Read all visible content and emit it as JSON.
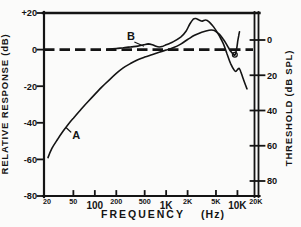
{
  "figure": {
    "background": "#fbfbfa",
    "ink": "#141414"
  },
  "chart_data": {
    "type": "line",
    "title": "",
    "xlabel_parts": [
      "FREQUENCY",
      "(Hz)"
    ],
    "x_scale": "log",
    "x_range_hz": [
      20,
      20000
    ],
    "grid": false,
    "legend": "none (curves labeled A and B with leader lines)",
    "left_axis": {
      "label": "RELATIVE RESPONSE (dB)",
      "tick_labels": [
        "+20",
        "0",
        "-20",
        "-40",
        "-60",
        "-80"
      ],
      "tick_values": [
        20,
        0,
        -20,
        -40,
        -60,
        -80
      ],
      "range": [
        -80,
        20
      ]
    },
    "right_axis": {
      "label": "THRESHOLD (dB SPL)",
      "tick_labels": [
        "0",
        "20",
        "40",
        "60",
        "80"
      ],
      "tick_values": [
        0,
        20,
        40,
        60,
        80
      ],
      "direction": "increases-downward",
      "style": "double-line"
    },
    "x_ticks": [
      {
        "hz": 20,
        "label": "20",
        "size": "small",
        "tick": false
      },
      {
        "hz": 50,
        "label": "50",
        "size": "small",
        "tick": true
      },
      {
        "hz": 100,
        "label": "100",
        "size": "large",
        "tick": true
      },
      {
        "hz": 200,
        "label": "200",
        "size": "small",
        "tick": true
      },
      {
        "hz": 500,
        "label": "500",
        "size": "small",
        "tick": true
      },
      {
        "hz": 1000,
        "label": "1K",
        "size": "large",
        "tick": true
      },
      {
        "hz": 2000,
        "label": "2K",
        "size": "small",
        "tick": true
      },
      {
        "hz": 5000,
        "label": "5K",
        "size": "small",
        "tick": true
      },
      {
        "hz": 10000,
        "label": "10K",
        "size": "large",
        "tick": true
      },
      {
        "hz": 20000,
        "label": "20K",
        "size": "small",
        "tick": false
      }
    ],
    "zero_line": {
      "value": 0,
      "style": "dashed"
    },
    "series": [
      {
        "name": "A",
        "points": [
          [
            22,
            -59
          ],
          [
            25,
            -54
          ],
          [
            30,
            -49
          ],
          [
            36,
            -44.5
          ],
          [
            43,
            -40.5
          ],
          [
            50,
            -37.5
          ],
          [
            63,
            -33
          ],
          [
            80,
            -28.5
          ],
          [
            100,
            -24.5
          ],
          [
            125,
            -20.5
          ],
          [
            160,
            -16.5
          ],
          [
            200,
            -13
          ],
          [
            250,
            -10
          ],
          [
            320,
            -7.5
          ],
          [
            400,
            -5.6
          ],
          [
            500,
            -4.1
          ],
          [
            630,
            -2.8
          ],
          [
            800,
            -1.5
          ],
          [
            1000,
            -0.3
          ],
          [
            1250,
            1
          ],
          [
            1600,
            3
          ],
          [
            2000,
            5.5
          ],
          [
            2500,
            7.8
          ],
          [
            3150,
            9.5
          ],
          [
            4000,
            10.6
          ],
          [
            4600,
            10.6
          ],
          [
            5000,
            9.8
          ],
          [
            5600,
            8.3
          ],
          [
            6300,
            5.8
          ],
          [
            7000,
            3
          ],
          [
            7500,
            1
          ],
          [
            8000,
            -0.8
          ],
          [
            8600,
            -2.2
          ],
          [
            9200,
            -3
          ],
          [
            9700,
            0
          ],
          [
            10100,
            4.5
          ],
          [
            10400,
            7.5
          ],
          [
            10700,
            9.8
          ]
        ]
      },
      {
        "name": "B",
        "points": [
          [
            150,
            0.2
          ],
          [
            200,
            0.6
          ],
          [
            250,
            1
          ],
          [
            320,
            1.5
          ],
          [
            400,
            1.9
          ],
          [
            480,
            2.6
          ],
          [
            560,
            3.1
          ],
          [
            640,
            2.7
          ],
          [
            720,
            1.8
          ],
          [
            800,
            1.4
          ],
          [
            900,
            1.8
          ],
          [
            1000,
            2.6
          ],
          [
            1120,
            3.4
          ],
          [
            1250,
            4.2
          ],
          [
            1600,
            6.8
          ],
          [
            1900,
            10
          ],
          [
            2150,
            14
          ],
          [
            2400,
            16.6
          ],
          [
            2600,
            17
          ],
          [
            2900,
            16.2
          ],
          [
            3200,
            15.6
          ],
          [
            3600,
            16.2
          ],
          [
            4000,
            15.2
          ],
          [
            4500,
            13
          ],
          [
            5000,
            10.5
          ],
          [
            5600,
            7.3
          ],
          [
            6300,
            3.5
          ],
          [
            7100,
            -2
          ],
          [
            8000,
            -7.5
          ],
          [
            9000,
            -11.2
          ],
          [
            9500,
            -11.9
          ],
          [
            10000,
            -11
          ],
          [
            10600,
            -10.3
          ],
          [
            11200,
            -12.3
          ],
          [
            12000,
            -15.8
          ],
          [
            13000,
            -19.5
          ],
          [
            13600,
            -21.5
          ]
        ]
      }
    ],
    "annotations": {
      "curve_labels": [
        {
          "text": "A",
          "hz": 55,
          "db": -49,
          "leader": [
            [
              46,
              -45
            ],
            [
              40,
              -42.8
            ]
          ]
        },
        {
          "text": "B",
          "hz": 322,
          "db": 5.5,
          "leader": [
            [
              365,
              4
            ],
            [
              480,
              2
            ]
          ]
        }
      ],
      "loop_artifact": {
        "hz": 9200,
        "db": -2.8,
        "note": "small self-crossing loop in curve A near its dip"
      }
    }
  }
}
